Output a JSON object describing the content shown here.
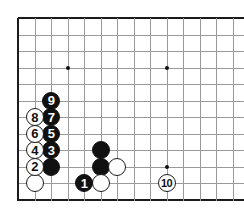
{
  "diagram": {
    "type": "go-board-diagram",
    "board": {
      "grid_spacing": 16.5,
      "origin_x": 18,
      "origin_y": 18,
      "cols_visible": 14,
      "rows_visible": 12,
      "line_color": "#9a9a9a",
      "edge_color": "#1b1b1b",
      "background": "#ffffff",
      "star_points": [
        {
          "col": 3,
          "row": 3
        },
        {
          "col": 9,
          "row": 3
        },
        {
          "col": 9,
          "row": 9
        }
      ]
    },
    "stones": [
      {
        "id": "move-1",
        "color": "black",
        "label": "1",
        "col": 4,
        "row": 10
      },
      {
        "id": "move-2",
        "color": "white",
        "label": "2",
        "col": 1,
        "row": 9
      },
      {
        "id": "move-3",
        "color": "black",
        "label": "3",
        "col": 2,
        "row": 8
      },
      {
        "id": "move-4",
        "color": "white",
        "label": "4",
        "col": 1,
        "row": 8
      },
      {
        "id": "move-5",
        "color": "black",
        "label": "5",
        "col": 2,
        "row": 7
      },
      {
        "id": "move-6",
        "color": "white",
        "label": "6",
        "col": 1,
        "row": 7
      },
      {
        "id": "move-7",
        "color": "black",
        "label": "7",
        "col": 2,
        "row": 6
      },
      {
        "id": "move-8",
        "color": "white",
        "label": "8",
        "col": 1,
        "row": 6
      },
      {
        "id": "move-9",
        "color": "black",
        "label": "9",
        "col": 2,
        "row": 5
      },
      {
        "id": "move-10",
        "color": "white",
        "label": "10",
        "col": 9,
        "row": 10
      },
      {
        "id": "stone-black-a",
        "color": "black",
        "label": "",
        "col": 2,
        "row": 9
      },
      {
        "id": "stone-black-b",
        "color": "black",
        "label": "",
        "col": 5,
        "row": 8
      },
      {
        "id": "stone-black-c",
        "color": "black",
        "label": "",
        "col": 5,
        "row": 9
      },
      {
        "id": "stone-white-a",
        "color": "white",
        "label": "",
        "col": 1,
        "row": 10
      },
      {
        "id": "stone-white-b",
        "color": "white",
        "label": "",
        "col": 5,
        "row": 10
      },
      {
        "id": "stone-white-c",
        "color": "white",
        "label": "",
        "col": 6,
        "row": 9
      }
    ]
  }
}
